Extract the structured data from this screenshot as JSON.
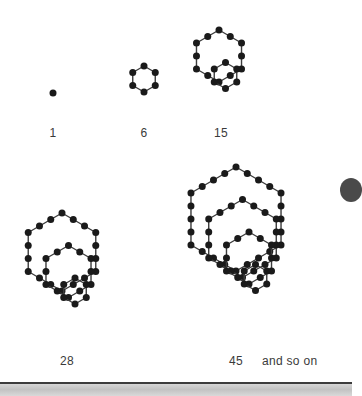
{
  "page": {
    "background_color": "#ffffff",
    "dot_color": "#1a1a1a",
    "line_color": "#3d3d3d",
    "label_color": "#3a3a3a",
    "rule_color": "#3c3c3c",
    "band_color": "#c9c9c9"
  },
  "labels": {
    "fig1": "1",
    "fig2": "6",
    "fig3": "15",
    "fig4": "28",
    "fig5": "45",
    "continuation": "and so on"
  },
  "chart_data": {
    "type": "scatter",
    "xlabel": "",
    "ylabel": "",
    "grid": false,
    "legend": "none",
    "categories": [
      "1",
      "6",
      "15",
      "28",
      "45"
    ],
    "values": [
      1,
      6,
      15,
      28,
      45
    ],
    "sequence_name": "hexagonal numbers",
    "formula": "n(2n-1)",
    "figures": [
      {
        "label": "1",
        "value": 1,
        "rings": 1,
        "ring_dot_counts": [
          1
        ],
        "center": [
          53,
          93
        ],
        "spacing": 0,
        "ring_sides": [
          0
        ],
        "offset_step": [
          0,
          0
        ]
      },
      {
        "label": "6",
        "value": 6,
        "rings": 1,
        "ring_dot_counts": [
          6
        ],
        "center": [
          144,
          79
        ],
        "spacing": 13,
        "ring_sides": [
          1
        ],
        "offset_step": [
          0,
          0
        ]
      },
      {
        "label": "15",
        "value": 15,
        "rings": 2,
        "ring_dot_counts": [
          12,
          6
        ],
        "center": [
          219,
          56
        ],
        "spacing": 13,
        "ring_sides": [
          2,
          1
        ],
        "offset_step": [
          6.5,
          19.5
        ]
      },
      {
        "label": "28",
        "value": 28,
        "rings": 3,
        "ring_dot_counts": [
          18,
          12,
          6
        ],
        "center": [
          62,
          252
        ],
        "spacing": 13,
        "ring_sides": [
          3,
          2,
          1
        ],
        "offset_step": [
          6.5,
          19.5
        ]
      },
      {
        "label": "45",
        "value": 45,
        "rings": 4,
        "ring_dot_counts": [
          24,
          18,
          12,
          6
        ],
        "center": [
          236,
          219
        ],
        "spacing": 13,
        "ring_sides": [
          4,
          3,
          2,
          1
        ],
        "offset_step": [
          6.5,
          19.5
        ]
      }
    ]
  }
}
